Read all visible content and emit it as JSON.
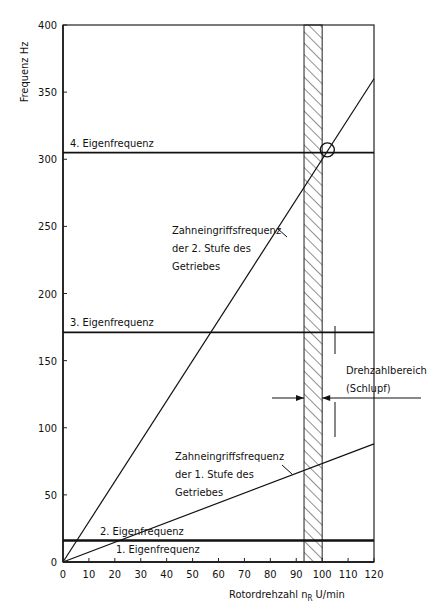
{
  "chart_data": {
    "type": "line",
    "title": "",
    "xlabel": "Rotordrehzahl n_R U/min",
    "xlabel_main": "Rotordrehzahl",
    "xlabel_symbol": "n",
    "xlabel_sub": "R",
    "xlabel_unit": "U/min",
    "ylabel": "Frequenz Hz",
    "xlim": [
      0,
      120
    ],
    "ylim": [
      0,
      400
    ],
    "xticks": [
      "0",
      "10",
      "20",
      "30",
      "40",
      "50",
      "60",
      "70",
      "80",
      "90",
      "100",
      "110",
      "120"
    ],
    "yticks": [
      "0",
      "50",
      "100",
      "150",
      "200",
      "250",
      "300",
      "350",
      "400"
    ],
    "grid": false,
    "series": [
      {
        "name": "1. Eigenfrequenz",
        "kind": "horizontal",
        "x": [
          0,
          120
        ],
        "y": [
          16,
          16
        ]
      },
      {
        "name": "2. Eigenfrequenz",
        "kind": "horizontal",
        "x": [
          0,
          120
        ],
        "y": [
          16,
          16
        ]
      },
      {
        "name": "3. Eigenfrequenz",
        "kind": "horizontal",
        "x": [
          0,
          120
        ],
        "y": [
          171,
          171
        ]
      },
      {
        "name": "4. Eigenfrequenz",
        "kind": "horizontal",
        "x": [
          0,
          120
        ],
        "y": [
          305,
          305
        ]
      },
      {
        "name": "Zahneingriffsfrequenz der 1. Stufe des Getriebes",
        "kind": "line",
        "x": [
          0,
          120
        ],
        "y": [
          0,
          88
        ]
      },
      {
        "name": "Zahneingriffsfrequenz der 2. Stufe des Getriebes",
        "kind": "line",
        "x": [
          0,
          120
        ],
        "y": [
          0,
          360
        ]
      }
    ],
    "shaded_band": {
      "label": "Drehzahlbereich (Schlupf)",
      "x_from": 93,
      "x_to": 100
    },
    "marker": {
      "shape": "circle",
      "x": 102,
      "y": 307
    }
  },
  "labels": {
    "eig1": "1. Eigenfrequenz",
    "eig2": "2. Eigenfrequenz",
    "eig3": "3. Eigenfrequenz",
    "eig4": "4. Eigenfrequenz",
    "stage2": [
      "Zahneingriffsfrequenz",
      "der 2. Stufe des",
      "Getriebes"
    ],
    "stage1": [
      "Zahneingriffsfrequenz",
      "der 1. Stufe des",
      "Getriebes"
    ],
    "band": [
      "Drehzahlbereich",
      "(Schlupf)"
    ]
  }
}
